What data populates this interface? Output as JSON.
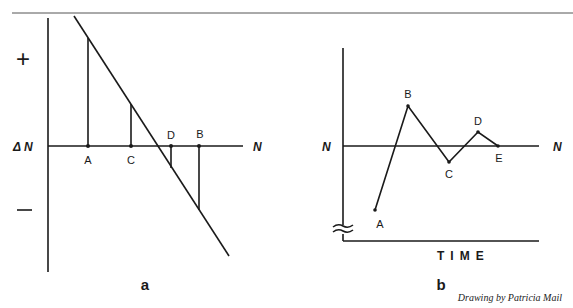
{
  "figure": {
    "colors": {
      "ink": "#1a1a1a",
      "background": "#ffffff",
      "rule": "#555555"
    },
    "panel_a": {
      "panel_label": "a",
      "y_axis_label": "Δ N",
      "x_axis_label": "N",
      "plus_sign": "+",
      "minus_sign": "—",
      "points": [
        {
          "label": "A",
          "x": 88,
          "top": 38
        },
        {
          "label": "C",
          "x": 131,
          "top": 104
        },
        {
          "label": "D",
          "x": 171,
          "bottom": 168
        },
        {
          "label": "B",
          "x": 199,
          "bottom": 210
        }
      ]
    },
    "panel_b": {
      "panel_label": "b",
      "y_axis_label": "N",
      "x_axis_label_right": "N",
      "time_label": "TIME",
      "points": [
        {
          "label": "A",
          "x": 375,
          "y": 210
        },
        {
          "label": "B",
          "x": 408,
          "y": 106
        },
        {
          "label": "C",
          "x": 449,
          "y": 162
        },
        {
          "label": "D",
          "x": 478,
          "y": 132
        },
        {
          "label": "E",
          "x": 498,
          "y": 146
        }
      ]
    },
    "credit": "Drawing by Patricia Mail"
  }
}
